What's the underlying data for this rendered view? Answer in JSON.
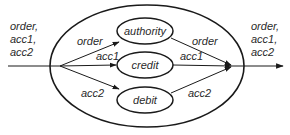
{
  "diagram": {
    "type": "process-flow",
    "input_label": [
      "order,",
      "acc1,",
      "acc2"
    ],
    "output_label": [
      "order,",
      "acc1,",
      "acc2"
    ],
    "nodes": [
      {
        "id": "authority",
        "label": "authority"
      },
      {
        "id": "credit",
        "label": "credit"
      },
      {
        "id": "debit",
        "label": "debit"
      }
    ],
    "edges": {
      "in_order": "order",
      "in_acc1": "acc1",
      "in_acc2": "acc2",
      "out_order": "order",
      "out_acc1": "acc1",
      "out_acc2": "acc2"
    },
    "colors": {
      "stroke": "#1a1a1a",
      "text": "#2a2a2a",
      "background": "#ffffff"
    }
  }
}
